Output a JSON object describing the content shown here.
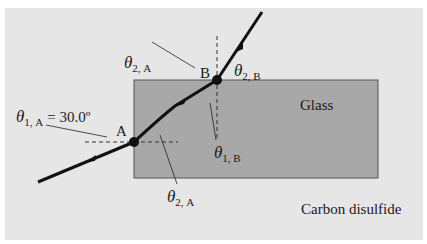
{
  "diagram": {
    "type": "refraction-ray-diagram",
    "colors": {
      "panel": "#e6e6e6",
      "glass": "#a8a8a8",
      "glass_border": "#555555",
      "ray": "#111111",
      "normal": "#333333"
    },
    "media": {
      "block": "Glass",
      "surrounding": "Carbon disulfide"
    },
    "points": {
      "A": "A",
      "B": "B"
    },
    "angles": {
      "theta_1A": {
        "symbol": "θ",
        "sub": "1, A",
        "value": "= 30.0º"
      },
      "theta_2A_top": {
        "symbol": "θ",
        "sub": "2, A"
      },
      "theta_2A_bottom": {
        "symbol": "θ",
        "sub": "2, A"
      },
      "theta_1B": {
        "symbol": "θ",
        "sub": "1, B"
      },
      "theta_2B": {
        "symbol": "θ",
        "sub": "2, B"
      }
    }
  }
}
